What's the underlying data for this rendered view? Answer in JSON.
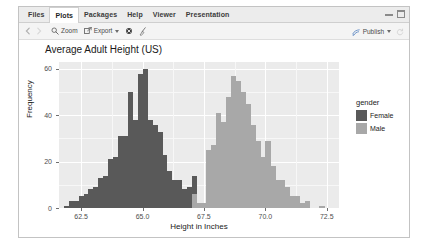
{
  "window": {
    "tabs": [
      {
        "label": "Files",
        "active": false
      },
      {
        "label": "Plots",
        "active": true
      },
      {
        "label": "Packages",
        "active": false
      },
      {
        "label": "Help",
        "active": false
      },
      {
        "label": "Viewer",
        "active": false
      },
      {
        "label": "Presentation",
        "active": false
      }
    ],
    "controls": [
      {
        "name": "minimize-button",
        "icon": "minimize-icon"
      },
      {
        "name": "maximize-button",
        "icon": "maximize-icon"
      }
    ]
  },
  "toolbar": {
    "back_icon": "back-arrow-icon",
    "forward_icon": "forward-arrow-icon",
    "zoom_label": "Zoom",
    "zoom_icon": "magnifier-icon",
    "export_label": "Export",
    "export_icon": "export-icon",
    "remove_plot_icon": "remove-plot-icon",
    "clear_plots_icon": "broom-icon",
    "publish_label": "Publish",
    "publish_icon": "publish-icon",
    "refresh_icon": "refresh-icon"
  },
  "chart_data": {
    "type": "bar",
    "title": "Average Adult Height (US)",
    "xlabel": "Height in Inches",
    "ylabel": "Frequency",
    "xlim": [
      61.6,
      73.0
    ],
    "ylim": [
      0,
      63
    ],
    "xticks": [
      "62.5",
      "65.0",
      "67.5",
      "70.0",
      "72.5"
    ],
    "xtick_values": [
      62.5,
      65.0,
      67.5,
      70.0,
      72.5
    ],
    "yticks": [
      "0",
      "20",
      "40",
      "60"
    ],
    "ytick_values": [
      0,
      20,
      40,
      60
    ],
    "grid": true,
    "legend": {
      "title": "gender",
      "position": "right",
      "entries": [
        {
          "label": "Female",
          "color": "#595959"
        },
        {
          "label": "Male",
          "color": "#a8a8a8"
        }
      ]
    },
    "bin_width": 0.2,
    "series": [
      {
        "name": "Female",
        "color": "#595959",
        "bins": [
          61.9,
          62.1,
          62.3,
          62.5,
          62.7,
          62.9,
          63.1,
          63.3,
          63.5,
          63.7,
          63.9,
          64.1,
          64.3,
          64.5,
          64.7,
          64.9,
          65.1,
          65.3,
          65.5,
          65.7,
          65.9,
          66.1,
          66.3,
          66.5,
          66.7,
          66.9,
          67.1,
          67.3
        ],
        "values": [
          1,
          3,
          3,
          5,
          6,
          8,
          9,
          13,
          14,
          21,
          22,
          31,
          31,
          50,
          38,
          58,
          60,
          38,
          36,
          33,
          23,
          16,
          12,
          12,
          8,
          9,
          14,
          2
        ]
      },
      {
        "name": "Male",
        "color": "#a8a8a8",
        "bins": [
          67.1,
          67.3,
          67.5,
          67.7,
          67.9,
          68.1,
          68.3,
          68.5,
          68.7,
          68.9,
          69.1,
          69.3,
          69.5,
          69.7,
          69.9,
          70.1,
          70.3,
          70.5,
          70.7,
          70.9,
          71.1,
          71.3,
          71.5,
          71.7,
          72.3
        ],
        "values": [
          6,
          2,
          2,
          25,
          27,
          41,
          37,
          48,
          57,
          55,
          50,
          45,
          36,
          29,
          22,
          29,
          18,
          12,
          12,
          9,
          5,
          5,
          2,
          3,
          1
        ]
      }
    ]
  }
}
